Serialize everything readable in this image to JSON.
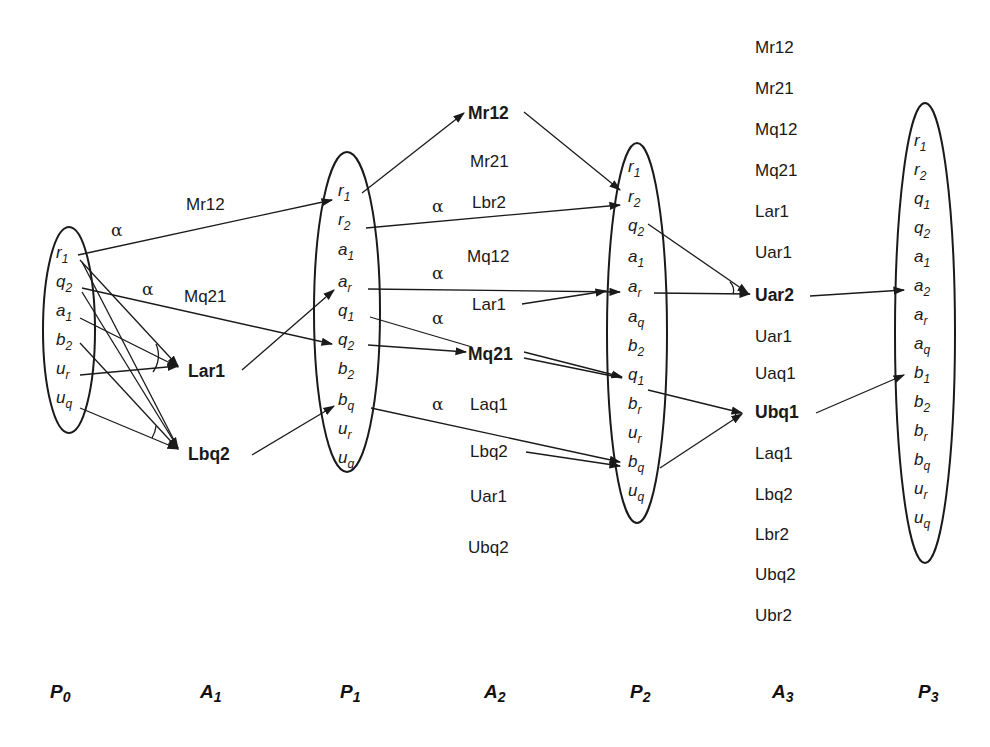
{
  "diagram": {
    "type": "planning-graph",
    "layers": [
      {
        "id": "P0",
        "kind": "proposition",
        "label": "P",
        "sub": "0",
        "items": [
          [
            "r",
            "1"
          ],
          [
            "q",
            "2"
          ],
          [
            "a",
            "1"
          ],
          [
            "b",
            "2"
          ],
          [
            "u",
            "r"
          ],
          [
            "u",
            "q"
          ]
        ]
      },
      {
        "id": "A1",
        "kind": "action",
        "label": "A",
        "sub": "1",
        "items": [
          "Mr12",
          "Mq21",
          "Lar1",
          "Lbq2"
        ],
        "bold": [
          "Lar1",
          "Lbq2"
        ]
      },
      {
        "id": "P1",
        "kind": "proposition",
        "label": "P",
        "sub": "1",
        "items": [
          [
            "r",
            "1"
          ],
          [
            "r",
            "2"
          ],
          [
            "a",
            "1"
          ],
          [
            "a",
            "r"
          ],
          [
            "q",
            "1"
          ],
          [
            "q",
            "2"
          ],
          [
            "b",
            "2"
          ],
          [
            "b",
            "q"
          ],
          [
            "u",
            "r"
          ],
          [
            "u",
            "q"
          ]
        ]
      },
      {
        "id": "A2",
        "kind": "action",
        "label": "A",
        "sub": "2",
        "items": [
          "Mr12",
          "Mr21",
          "Lbr2",
          "Mq12",
          "Lar1",
          "Mq21",
          "Laq1",
          "Lbq2",
          "Uar1",
          "Ubq2"
        ],
        "bold": [
          "Mr12",
          "Mq21"
        ]
      },
      {
        "id": "P2",
        "kind": "proposition",
        "label": "P",
        "sub": "2",
        "items": [
          [
            "r",
            "1"
          ],
          [
            "r",
            "2"
          ],
          [
            "q",
            "2"
          ],
          [
            "a",
            "1"
          ],
          [
            "a",
            "r"
          ],
          [
            "a",
            "q"
          ],
          [
            "b",
            "2"
          ],
          [
            "q",
            "1"
          ],
          [
            "b",
            "r"
          ],
          [
            "u",
            "r"
          ],
          [
            "b",
            "q"
          ],
          [
            "u",
            "q"
          ]
        ]
      },
      {
        "id": "A3",
        "kind": "action",
        "label": "A",
        "sub": "3",
        "items": [
          "Mr12",
          "Mr21",
          "Mq12",
          "Mq21",
          "Lar1",
          "Uar1",
          "Uar2",
          "Uar1",
          "Uaq1",
          "Ubq1",
          "Laq1",
          "Lbq2",
          "Lbr2",
          "Ubq2",
          "Ubr2"
        ],
        "bold": [
          "Uar2",
          "Ubq1"
        ]
      },
      {
        "id": "P3",
        "kind": "proposition",
        "label": "P",
        "sub": "3",
        "items": [
          [
            "r",
            "1"
          ],
          [
            "r",
            "2"
          ],
          [
            "q",
            "1"
          ],
          [
            "q",
            "2"
          ],
          [
            "a",
            "1"
          ],
          [
            "a",
            "2"
          ],
          [
            "a",
            "r"
          ],
          [
            "a",
            "q"
          ],
          [
            "b",
            "1"
          ],
          [
            "b",
            "2"
          ],
          [
            "b",
            "r"
          ],
          [
            "b",
            "q"
          ],
          [
            "u",
            "r"
          ],
          [
            "u",
            "q"
          ]
        ]
      }
    ],
    "alpha_label": "α",
    "edges": [
      {
        "from": "P0.r1",
        "to": "P1.r1",
        "via": "Mr12",
        "alpha": true
      },
      {
        "from": "P0.q2",
        "to": "P1.q2",
        "via": "Mq21",
        "alpha": true
      },
      {
        "from": "P0.r1",
        "to": "A1.Lar1"
      },
      {
        "from": "P0.a1",
        "to": "A1.Lar1"
      },
      {
        "from": "P0.ur",
        "to": "A1.Lar1"
      },
      {
        "from": "P0.q2",
        "to": "A1.Lbq2"
      },
      {
        "from": "P0.b2",
        "to": "A1.Lbq2"
      },
      {
        "from": "P0.uq",
        "to": "A1.Lbq2"
      },
      {
        "from": "P0.r1",
        "to": "A1.Lbq2"
      },
      {
        "from": "A1.Lar1",
        "to": "P1.ar"
      },
      {
        "from": "A1.Lbq2",
        "to": "P1.bq"
      },
      {
        "from": "P1.r1",
        "to": "A2.Mr12"
      },
      {
        "from": "P1.r2",
        "to": "P2.r2",
        "alpha": true
      },
      {
        "from": "P1.ar",
        "to": "P2.ar",
        "alpha": true
      },
      {
        "from": "P1.q1",
        "to": "P2.q1",
        "alpha": true
      },
      {
        "from": "P1.q2",
        "to": "A2.Mq21"
      },
      {
        "from": "P1.bq",
        "to": "P2.bq",
        "alpha": true
      },
      {
        "from": "A2.Mr12",
        "to": "P2.r2"
      },
      {
        "from": "A2.Lar1",
        "to": "P2.ar"
      },
      {
        "from": "A2.Mq21",
        "to": "P2.q1"
      },
      {
        "from": "A2.Lbq2",
        "to": "P2.bq"
      },
      {
        "from": "P2.q2",
        "to": "A3.Uar2"
      },
      {
        "from": "P2.ar",
        "to": "A3.Uar2"
      },
      {
        "from": "P2.q1",
        "to": "A3.Ubq1"
      },
      {
        "from": "P2.bq",
        "to": "A3.Ubq1"
      },
      {
        "from": "A3.Uar2",
        "to": "P3.a2"
      },
      {
        "from": "A3.Ubq1",
        "to": "P3.b1"
      }
    ]
  }
}
